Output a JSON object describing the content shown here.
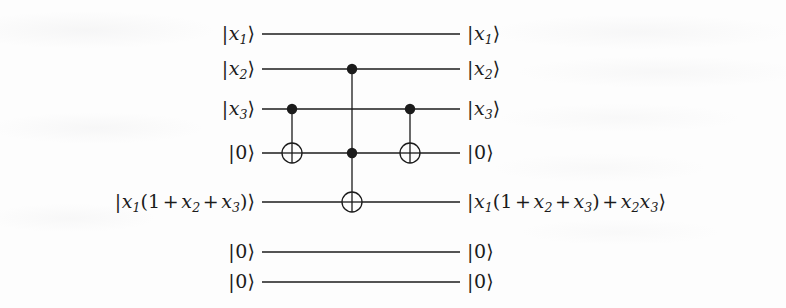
{
  "figure": {
    "kind": "quantum-circuit-diagram",
    "width": 786,
    "height": 308,
    "background_color": "#fdfdfd",
    "ink_color": "#1b1b1b"
  },
  "chart_data": {
    "type": "diagram",
    "title": "",
    "wire_count": 7,
    "wire_x_start": 262,
    "wire_x_end": 460,
    "wires": [
      {
        "index": 0,
        "y": 34,
        "left_label": "|x_1>",
        "right_label": "|x_1>"
      },
      {
        "index": 1,
        "y": 69,
        "left_label": "|x_2>",
        "right_label": "|x_2>"
      },
      {
        "index": 2,
        "y": 109,
        "left_label": "|x_3>",
        "right_label": "|x_3>"
      },
      {
        "index": 3,
        "y": 153,
        "left_label": "|0>",
        "right_label": "|0>"
      },
      {
        "index": 4,
        "y": 202,
        "left_label": "|x_1(1+x_2+x_3)>",
        "right_label": "|x_1(1+x_2+x_3)+x_2x_3>"
      },
      {
        "index": 5,
        "y": 252,
        "left_label": "|0>",
        "right_label": "|0>"
      },
      {
        "index": 6,
        "y": 282,
        "left_label": "|0>",
        "right_label": "|0>"
      }
    ],
    "gates": [
      {
        "id": "cnot-1",
        "name": "CNOT",
        "x": 292,
        "controls": [
          2
        ],
        "target": 3,
        "control_ys": [
          109
        ],
        "target_y": 153
      },
      {
        "id": "toffoli",
        "name": "Toffoli",
        "x": 352,
        "controls": [
          1,
          3
        ],
        "target": 4,
        "control_ys": [
          69,
          153
        ],
        "target_y": 202
      },
      {
        "id": "cnot-2",
        "name": "CNOT",
        "x": 410,
        "controls": [
          2
        ],
        "target": 3,
        "control_ys": [
          109
        ],
        "target_y": 153
      }
    ],
    "style": {
      "wire_width": 1.3,
      "control_dot_radius": 5.2,
      "target_radius": 10
    }
  },
  "labels": {
    "left": [
      {
        "name": "ket-left-x1",
        "html": "<span class='bar'>|</span><span class='var'>x</span><span class='sub'>1</span><span class='rang'>&#10217;</span>"
      },
      {
        "name": "ket-left-x2",
        "html": "<span class='bar'>|</span><span class='var'>x</span><span class='sub'>2</span><span class='rang'>&#10217;</span>"
      },
      {
        "name": "ket-left-x3",
        "html": "<span class='bar'>|</span><span class='var'>x</span><span class='sub'>3</span><span class='rang'>&#10217;</span>"
      },
      {
        "name": "ket-left-zero-1",
        "html": "<span class='bar'>|</span><span class='num'>0</span><span class='rang'>&#10217;</span>"
      },
      {
        "name": "ket-left-expr",
        "html": "<span class='bar'>|</span><span class='var'>x</span><span class='sub'>1</span><span class='paren'>(</span><span class='num'>1</span><span class='op'>+</span><span class='var'>x</span><span class='sub'>2</span><span class='op'>+</span><span class='var'>x</span><span class='sub'>3</span><span class='paren'>)</span><span class='rang'>&#10217;</span>"
      },
      {
        "name": "ket-left-zero-2",
        "html": "<span class='bar'>|</span><span class='num'>0</span><span class='rang'>&#10217;</span>"
      },
      {
        "name": "ket-left-zero-3",
        "html": "<span class='bar'>|</span><span class='num'>0</span><span class='rang'>&#10217;</span>"
      }
    ],
    "right": [
      {
        "name": "ket-right-x1",
        "html": "<span class='bar'>|</span><span class='var'>x</span><span class='sub'>1</span><span class='rang'>&#10217;</span>"
      },
      {
        "name": "ket-right-x2",
        "html": "<span class='bar'>|</span><span class='var'>x</span><span class='sub'>2</span><span class='rang'>&#10217;</span>"
      },
      {
        "name": "ket-right-x3",
        "html": "<span class='bar'>|</span><span class='var'>x</span><span class='sub'>3</span><span class='rang'>&#10217;</span>"
      },
      {
        "name": "ket-right-zero-1",
        "html": "<span class='bar'>|</span><span class='num'>0</span><span class='rang'>&#10217;</span>"
      },
      {
        "name": "ket-right-expr",
        "html": "<span class='bar'>|</span><span class='var'>x</span><span class='sub'>1</span><span class='paren'>(</span><span class='num'>1</span><span class='op'>+</span><span class='var'>x</span><span class='sub'>2</span><span class='op'>+</span><span class='var'>x</span><span class='sub'>3</span><span class='paren'>)</span><span class='op'>+</span><span class='var'>x</span><span class='sub'>2</span><span class='var'>x</span><span class='sub'>3</span><span class='rang'>&#10217;</span>"
      },
      {
        "name": "ket-right-zero-2",
        "html": "<span class='bar'>|</span><span class='num'>0</span><span class='rang'>&#10217;</span>"
      },
      {
        "name": "ket-right-zero-3",
        "html": "<span class='bar'>|</span><span class='num'>0</span><span class='rang'>&#10217;</span>"
      }
    ],
    "left_text_plain": [
      "|x1⟩",
      "|x2⟩",
      "|x3⟩",
      "|0⟩",
      "|x1(1 + x2 + x3)⟩",
      "|0⟩",
      "|0⟩"
    ],
    "right_text_plain": [
      "|x1⟩",
      "|x2⟩",
      "|x3⟩",
      "|0⟩",
      "|x1(1 + x2 + x3) + x2x3⟩",
      "|0⟩",
      "|0⟩"
    ]
  }
}
